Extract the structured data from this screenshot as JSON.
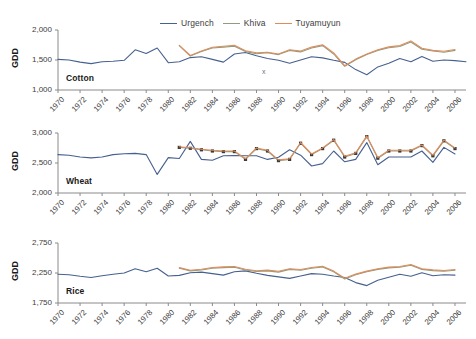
{
  "legend": {
    "position": "top-center",
    "items": [
      {
        "label": "Urgench",
        "color": "#46608f",
        "icon": "line-swatch"
      },
      {
        "label": "Khiva",
        "color": "#8c9e7e",
        "icon": "line-swatch"
      },
      {
        "label": "Tuyamuyun",
        "color": "#e08b5c",
        "icon": "line-swatch"
      }
    ]
  },
  "axis_title": "GDD",
  "stray_mark": "x",
  "chart_data": [
    {
      "type": "line",
      "title": "Cotton",
      "xlabel": "",
      "ylabel": "GDD",
      "ylim": [
        1000,
        2000
      ],
      "yticks": [
        1000,
        1500,
        2000
      ],
      "ytick_labels": [
        "1,000",
        "1,500",
        "2,000"
      ],
      "xlim": [
        1970,
        2007
      ],
      "xticks": [
        1970,
        1972,
        1974,
        1976,
        1978,
        1980,
        1982,
        1984,
        1986,
        1988,
        1990,
        1992,
        1994,
        1996,
        1998,
        2000,
        2002,
        2004,
        2006
      ],
      "grid": false,
      "series": [
        {
          "name": "Urgench",
          "color": "#46608f",
          "markers": false,
          "x": [
            1970,
            1971,
            1972,
            1973,
            1974,
            1975,
            1976,
            1977,
            1978,
            1979,
            1980,
            1981,
            1982,
            1983,
            1984,
            1985,
            1986,
            1987,
            1988,
            1989,
            1990,
            1991,
            1992,
            1993,
            1994,
            1995,
            1996,
            1997,
            1998,
            1999,
            2000,
            2001,
            2002,
            2003,
            2004,
            2005,
            2006,
            2007
          ],
          "values": [
            1510,
            1500,
            1465,
            1440,
            1470,
            1480,
            1495,
            1670,
            1610,
            1700,
            1455,
            1470,
            1540,
            1555,
            1510,
            1465,
            1600,
            1625,
            1570,
            1525,
            1495,
            1445,
            1500,
            1555,
            1535,
            1495,
            1460,
            1340,
            1255,
            1385,
            1445,
            1525,
            1470,
            1560,
            1480,
            1500,
            1490,
            1470,
            1465,
            1495,
            1415,
            1380,
            1510,
            1640,
            1500,
            1485
          ]
        },
        {
          "name": "Khiva",
          "color": "#8c9e7e",
          "markers": false,
          "x": [
            1981,
            1982,
            1983,
            1984,
            1985,
            1986,
            1987,
            1988,
            1989,
            1990,
            1991,
            1992,
            1993,
            1994,
            1995,
            1996,
            1997,
            1998,
            1999,
            2000,
            2001,
            2002,
            2003,
            2004,
            2005,
            2006
          ],
          "values": [
            1740,
            1565,
            1640,
            1700,
            1715,
            1730,
            1640,
            1605,
            1620,
            1590,
            1660,
            1635,
            1700,
            1740,
            1600,
            1395,
            1505,
            1590,
            1660,
            1705,
            1725,
            1800,
            1680,
            1650,
            1630,
            1660
          ]
        },
        {
          "name": "Tuyamuyun",
          "color": "#e08b5c",
          "markers": false,
          "x": [
            1981,
            1982,
            1983,
            1984,
            1985,
            1986,
            1987,
            1988,
            1989,
            1990,
            1991,
            1992,
            1993,
            1994,
            1995,
            1996,
            1997,
            1998,
            1999,
            2000,
            2001,
            2002,
            2003,
            2004,
            2005,
            2006
          ],
          "values": [
            1745,
            1575,
            1650,
            1712,
            1730,
            1745,
            1655,
            1620,
            1630,
            1600,
            1672,
            1650,
            1715,
            1755,
            1618,
            1405,
            1515,
            1600,
            1672,
            1718,
            1740,
            1818,
            1695,
            1660,
            1645,
            1675
          ]
        }
      ]
    },
    {
      "type": "line",
      "title": "Wheat",
      "xlabel": "",
      "ylabel": "GDD",
      "ylim": [
        2000,
        3000
      ],
      "yticks": [
        2000,
        2500,
        3000
      ],
      "ytick_labels": [
        "2,000",
        "2,500",
        "3,000"
      ],
      "xlim": [
        1970,
        2007
      ],
      "xticks": [
        1970,
        1972,
        1974,
        1976,
        1978,
        1980,
        1982,
        1984,
        1986,
        1988,
        1990,
        1992,
        1994,
        1996,
        1998,
        2000,
        2002,
        2004,
        2006
      ],
      "grid": false,
      "series": [
        {
          "name": "Urgench",
          "color": "#46608f",
          "markers": false,
          "x": [
            1970,
            1971,
            1972,
            1973,
            1974,
            1975,
            1976,
            1977,
            1978,
            1979,
            1980,
            1981,
            1982,
            1983,
            1984,
            1985,
            1986,
            1987,
            1988,
            1989,
            1990,
            1991,
            1992,
            1993,
            1994,
            1995,
            1996,
            1997,
            1998,
            1999,
            2000,
            2001,
            2002,
            2003,
            2004,
            2005,
            2006
          ],
          "values": [
            2640,
            2630,
            2600,
            2585,
            2600,
            2640,
            2655,
            2660,
            2640,
            2310,
            2590,
            2575,
            2860,
            2560,
            2545,
            2620,
            2625,
            2620,
            2620,
            2560,
            2595,
            2720,
            2630,
            2450,
            2490,
            2700,
            2520,
            2560,
            2840,
            2470,
            2600,
            2600,
            2600,
            2700,
            2510,
            2760,
            2650,
            2330,
            2620,
            2700,
            2650,
            2540
          ]
        },
        {
          "name": "Khiva",
          "color": "#8c9e7e",
          "markers": true,
          "x": [
            1981,
            1982,
            1983,
            1984,
            1985,
            1986,
            1987,
            1988,
            1989,
            1990,
            1991,
            1992,
            1993,
            1994,
            1995,
            1996,
            1997,
            1998,
            1999,
            2000,
            2001,
            2002,
            2003,
            2004,
            2005,
            2006
          ],
          "values": [
            2760,
            2745,
            2720,
            2700,
            2690,
            2690,
            2560,
            2740,
            2700,
            2540,
            2560,
            2830,
            2640,
            2740,
            2880,
            2600,
            2660,
            2940,
            2580,
            2700,
            2700,
            2700,
            2790,
            2620,
            2870,
            2740
          ]
        },
        {
          "name": "Tuyamuyun",
          "color": "#e08b5c",
          "markers": false,
          "x": [
            1981,
            1982,
            1983,
            1984,
            1985,
            1986,
            1987,
            1988,
            1989,
            1990,
            1991,
            1992,
            1993,
            1994,
            1995,
            1996,
            1997,
            1998,
            1999,
            2000,
            2001,
            2002,
            2003,
            2004,
            2005,
            2006
          ],
          "values": [
            2770,
            2755,
            2730,
            2712,
            2700,
            2700,
            2570,
            2750,
            2712,
            2552,
            2572,
            2842,
            2650,
            2752,
            2890,
            2612,
            2672,
            2952,
            2590,
            2712,
            2712,
            2712,
            2800,
            2632,
            2882,
            2752
          ]
        }
      ]
    },
    {
      "type": "line",
      "title": "Rice",
      "xlabel": "",
      "ylabel": "GDD",
      "ylim": [
        1750,
        2750
      ],
      "yticks": [
        1750,
        2250,
        2750
      ],
      "ytick_labels": [
        "1,750",
        "2,250",
        "2,750"
      ],
      "xlim": [
        1970,
        2007
      ],
      "xticks": [
        1970,
        1972,
        1974,
        1976,
        1978,
        1980,
        1982,
        1984,
        1986,
        1988,
        1990,
        1992,
        1994,
        1996,
        1998,
        2000,
        2002,
        2004,
        2006
      ],
      "grid": false,
      "series": [
        {
          "name": "Urgench",
          "color": "#46608f",
          "markers": false,
          "x": [
            1970,
            1971,
            1972,
            1973,
            1974,
            1975,
            1976,
            1977,
            1978,
            1979,
            1980,
            1981,
            1982,
            1983,
            1984,
            1985,
            1986,
            1987,
            1988,
            1989,
            1990,
            1991,
            1992,
            1993,
            1994,
            1995,
            1996,
            1997,
            1998,
            1999,
            2000,
            2001,
            2002,
            2003,
            2004,
            2005,
            2006
          ],
          "values": [
            2230,
            2220,
            2195,
            2175,
            2205,
            2230,
            2250,
            2320,
            2270,
            2330,
            2200,
            2210,
            2255,
            2265,
            2240,
            2215,
            2270,
            2285,
            2245,
            2210,
            2185,
            2160,
            2200,
            2240,
            2230,
            2200,
            2175,
            2090,
            2040,
            2130,
            2180,
            2230,
            2195,
            2255,
            2205,
            2220,
            2215,
            2200,
            2195,
            2215,
            2165,
            2145,
            2230,
            2300,
            2220,
            2210
          ]
        },
        {
          "name": "Khiva",
          "color": "#8c9e7e",
          "markers": false,
          "x": [
            1981,
            1982,
            1983,
            1984,
            1985,
            1986,
            1987,
            1988,
            1989,
            1990,
            1991,
            1992,
            1993,
            1994,
            1995,
            1996,
            1997,
            1998,
            1999,
            2000,
            2001,
            2002,
            2003,
            2004,
            2005,
            2006
          ],
          "values": [
            2330,
            2285,
            2300,
            2330,
            2340,
            2345,
            2300,
            2275,
            2285,
            2265,
            2310,
            2295,
            2330,
            2350,
            2270,
            2150,
            2220,
            2270,
            2310,
            2335,
            2345,
            2380,
            2310,
            2290,
            2280,
            2295
          ]
        },
        {
          "name": "Tuyamuyun",
          "color": "#e08b5c",
          "markers": false,
          "x": [
            1981,
            1982,
            1983,
            1984,
            1985,
            1986,
            1987,
            1988,
            1989,
            1990,
            1991,
            1992,
            1993,
            1994,
            1995,
            1996,
            1997,
            1998,
            1999,
            2000,
            2001,
            2002,
            2003,
            2004,
            2005,
            2006
          ],
          "values": [
            2340,
            2295,
            2312,
            2342,
            2352,
            2358,
            2312,
            2288,
            2298,
            2278,
            2322,
            2308,
            2342,
            2362,
            2282,
            2162,
            2232,
            2282,
            2322,
            2348,
            2358,
            2392,
            2322,
            2302,
            2292,
            2308
          ]
        }
      ]
    }
  ]
}
